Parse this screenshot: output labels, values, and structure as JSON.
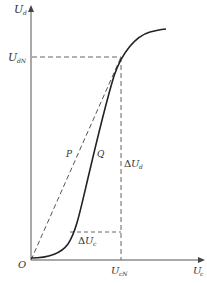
{
  "diagram": {
    "type": "characteristic-curve",
    "axes": {
      "y_label": {
        "main": "U",
        "sub": "d"
      },
      "x_label": {
        "main": "U",
        "sub": "c"
      },
      "origin_label": "O"
    },
    "markers": {
      "y_marker": {
        "main": "U",
        "sub": "dN"
      },
      "x_marker": {
        "main": "U",
        "sub": "cN"
      }
    },
    "annotations": {
      "line_p": "P",
      "curve_q": "Q",
      "delta_ud": {
        "delta": "Δ",
        "main": "U",
        "sub": "d"
      },
      "delta_uc": {
        "delta": "Δ",
        "main": "U",
        "sub": "c"
      }
    },
    "colors": {
      "axis": "#555555",
      "curve": "#222222",
      "dashed": "#666666"
    }
  }
}
